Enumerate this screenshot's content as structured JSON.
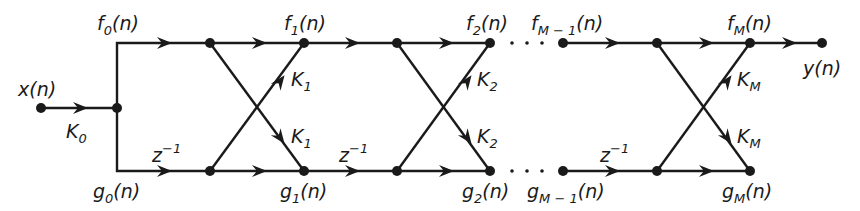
{
  "diagram": {
    "type": "lattice-filter-signal-flow-graph",
    "input": {
      "label": "x(n)",
      "gain": "K",
      "gain_sub": "0"
    },
    "output": {
      "label": "y(n)"
    },
    "top_labels": [
      {
        "base": "f",
        "sub": "0",
        "tail": "(n)"
      },
      {
        "base": "f",
        "sub": "1",
        "tail": "(n)"
      },
      {
        "base": "f",
        "sub": "2",
        "tail": "(n)"
      },
      {
        "base": "f",
        "sub": "M − 1",
        "tail": "(n)"
      },
      {
        "base": "f",
        "sub": "M",
        "tail": "(n)"
      }
    ],
    "bottom_labels": [
      {
        "base": "g",
        "sub": "0",
        "tail": "(n)"
      },
      {
        "base": "g",
        "sub": "1",
        "tail": "(n)"
      },
      {
        "base": "g",
        "sub": "2",
        "tail": "(n)"
      },
      {
        "base": "g",
        "sub": "M − 1",
        "tail": "(n)"
      },
      {
        "base": "g",
        "sub": "M",
        "tail": "(n)"
      }
    ],
    "delay_label": {
      "base": "z",
      "sup": "−1"
    },
    "stages": [
      {
        "coef_base": "K",
        "coef_sub": "1"
      },
      {
        "coef_base": "K",
        "coef_sub": "2"
      },
      {
        "coef_base": "K",
        "coef_sub": "M"
      }
    ],
    "ellipsis": "· · ·"
  }
}
